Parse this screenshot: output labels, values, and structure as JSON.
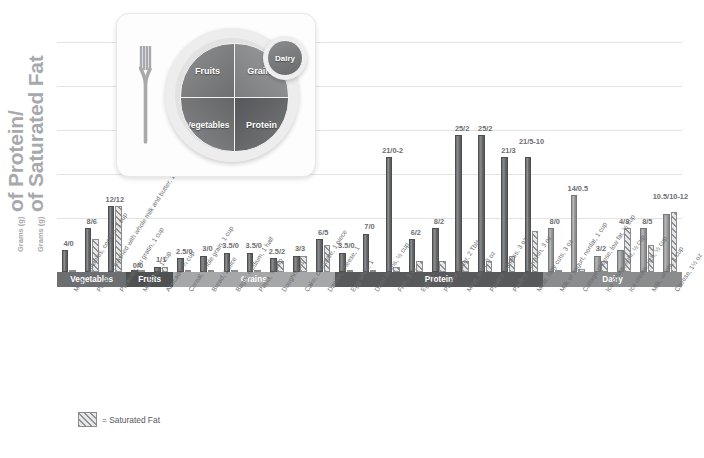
{
  "axis": {
    "ytitle_line1_small": "Grams (g)",
    "ytitle_line1_big": "of Protein/",
    "ytitle_line2_small": "Grams (g)",
    "ytitle_line2_big": "of Saturated Fat"
  },
  "legend": {
    "saturated_fat_label": "= Saturated Fat"
  },
  "caption": {
    "text": ""
  },
  "plate": {
    "fruits": "Fruits",
    "grains": "Grains",
    "vegetables": "Vegetables",
    "protein": "Protein",
    "dairy": "Dairy"
  },
  "chart_data": {
    "type": "bar",
    "title": "",
    "xlabel": "",
    "ylabel": "Grams (g) of Protein/Grams (g) of Saturated Fat",
    "ylim": [
      0,
      27
    ],
    "grid": true,
    "legend_position": "bottom-left",
    "series": [
      {
        "name": "Protein",
        "values": [
          4,
          8,
          12,
          0,
          1,
          2.5,
          3,
          3.5,
          3.5,
          2.5,
          3,
          6,
          3.5,
          7,
          21,
          6,
          8,
          25,
          25,
          21,
          21,
          8,
          14,
          3,
          4,
          8,
          10.5
        ]
      },
      {
        "name": "Saturated Fat",
        "values": [
          0,
          6,
          12,
          0,
          1,
          0,
          0,
          0,
          0,
          2,
          3,
          5,
          0,
          0,
          1,
          2,
          2,
          2,
          2,
          3,
          7.5,
          0,
          0.5,
          2,
          8,
          5,
          11
        ]
      }
    ],
    "categories": [
      "Most vegetables, cooked, 1 cup",
      "Potatoes, mashed with whole milk and butter, 1 cup",
      "Potatoes, au gratin, 1 cup",
      "Most fruit, 1 cup",
      "Avocado, ¼ cup",
      "Cereal, whole grain, 1 cup",
      "Bread, 1 slice",
      "Bagel, medium, 1 half",
      "Pasta, ½ cup",
      "Doughnut, 1",
      "Cake, chocolate, 1 piece",
      "Danish, cheese, 1",
      "Egg white, 1",
      "Dried beans, ½ cup",
      "Fish, 3 oz",
      "Egg, 1",
      "Peanut butter, 2 Tbls",
      "Meat, lean, 3 oz",
      "Poultry, skinless, 3 oz",
      "Poultry, with skin, 3 oz",
      "Meat, fatty cuts, 3 oz",
      "Milk or yogurt, nonfat, 1 cup",
      "Cottage cheese, low fat, ½ cup",
      "Ice cream, light, ½ cup",
      "Ice cream, rich, ½ cup",
      "Milk, whole, 1 cup",
      "Cheese, 1½ oz"
    ],
    "value_labels": [
      "4/0",
      "8/6",
      "12/12",
      "0/0",
      "1/1",
      "2.5/0",
      "3/0",
      "3.5/0",
      "3.5/0",
      "2.5/2",
      "3/3",
      "6/5",
      "3.5/0",
      "7/0",
      "21/0-2",
      "6/2",
      "8/2",
      "25/2",
      "25/2",
      "21/3",
      "21/\n5-10",
      "8/0",
      "14/0.5",
      "3/2",
      "4/8",
      "8/5",
      "10.5/\n10-12"
    ],
    "groups": [
      {
        "name": "Vegetables",
        "count": 3,
        "color": "#6d6e71"
      },
      {
        "name": "Fruits",
        "count": 2,
        "color": "#4f5052"
      },
      {
        "name": "Grains",
        "count": 7,
        "color": "#a5a7a9"
      },
      {
        "name": "Protein",
        "count": 9,
        "color": "#58595b"
      },
      {
        "name": "Dairy",
        "count": 6,
        "color": "#8a8c8e"
      }
    ]
  }
}
